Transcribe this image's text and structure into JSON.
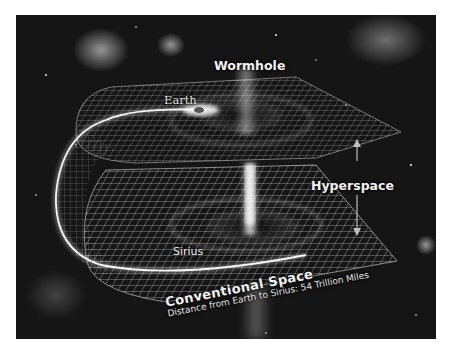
{
  "diagram": {
    "title": "Wormhole",
    "labels": {
      "wormhole": "Wormhole",
      "earth": "Earth",
      "hyperspace": "Hyperspace",
      "sirius": "Sirius",
      "conventional_space": "Conventional Space",
      "distance": "Distance from Earth to Sirius: 54 Trillion Miles"
    },
    "colors": {
      "background": "#151515",
      "grid": "#d8d8d8",
      "glow": "#ffffff",
      "text": "#f2f2f2",
      "page": "#ffffff"
    }
  }
}
